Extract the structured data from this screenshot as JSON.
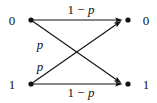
{
  "diagram": {
    "type": "binary-symmetric-channel",
    "background_color": "#ffffff",
    "stroke_color": "#111111",
    "input_nodes": [
      {
        "id": "in-0",
        "label": "0",
        "x": 31,
        "y": 20
      },
      {
        "id": "in-1",
        "label": "1",
        "x": 31,
        "y": 84
      }
    ],
    "output_nodes": [
      {
        "id": "out-0",
        "label": "0",
        "x": 128,
        "y": 20
      },
      {
        "id": "out-1",
        "label": "1",
        "x": 128,
        "y": 84
      }
    ],
    "edges": [
      {
        "id": "edge-0-0",
        "from": "in-0",
        "to": "out-0",
        "label_prefix": "1 − ",
        "label_var": "p",
        "label_full": "1 − p"
      },
      {
        "id": "edge-0-1",
        "from": "in-0",
        "to": "out-1",
        "label_prefix": "",
        "label_var": "p",
        "label_full": "p"
      },
      {
        "id": "edge-1-0",
        "from": "in-1",
        "to": "out-0",
        "label_prefix": "",
        "label_var": "p",
        "label_full": "p"
      },
      {
        "id": "edge-1-1",
        "from": "in-1",
        "to": "out-1",
        "label_prefix": "1 − ",
        "label_var": "p",
        "label_full": "1 − p"
      }
    ],
    "labels": {
      "input_top": "0",
      "input_bottom": "1",
      "output_top": "0",
      "output_bottom": "1",
      "top_edge": "1 − ",
      "top_edge_var": "p",
      "bottom_edge": "1 − ",
      "bottom_edge_var": "p",
      "upper_cross": "p",
      "lower_cross": "p"
    }
  }
}
